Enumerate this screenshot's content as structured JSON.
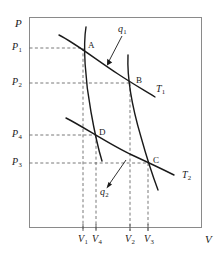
{
  "figure": {
    "kind": "carnot-cycle-pv-diagram",
    "axes": {
      "y_axis_label": "P",
      "x_axis_label": "V",
      "frame_color": "#8a8a8a",
      "curve_color": "#1a1a1a",
      "dash_color": "#555555"
    },
    "y_ticks": [
      {
        "label": "P",
        "sub": "1",
        "y": 48
      },
      {
        "label": "P",
        "sub": "2",
        "y": 83
      },
      {
        "label": "P",
        "sub": "4",
        "y": 135
      },
      {
        "label": "P",
        "sub": "3",
        "y": 163
      }
    ],
    "x_ticks": [
      {
        "label": "V",
        "sub": "1",
        "x": 83
      },
      {
        "label": "V",
        "sub": "4",
        "x": 96
      },
      {
        "label": "V",
        "sub": "2",
        "x": 130
      },
      {
        "label": "V",
        "sub": "3",
        "x": 148
      }
    ],
    "points": [
      {
        "name": "A",
        "label": "A",
        "x": 83,
        "y": 48,
        "label_x": 88,
        "label_y": 43
      },
      {
        "name": "B",
        "label": "B",
        "x": 130,
        "y": 83,
        "label_x": 136,
        "label_y": 78
      },
      {
        "name": "C",
        "label": "C",
        "x": 148,
        "y": 163,
        "label_x": 154,
        "label_y": 158
      },
      {
        "name": "D",
        "label": "D",
        "x": 95,
        "y": 135,
        "label_x": 100,
        "label_y": 130
      }
    ],
    "curves": [
      {
        "name": "isotherm-T1",
        "label": "T",
        "sub": "1",
        "label_x": 158,
        "label_y": 88
      },
      {
        "name": "isotherm-T2",
        "label": "T",
        "sub": "2",
        "label_x": 184,
        "label_y": 174
      },
      {
        "name": "adiabat-AD"
      },
      {
        "name": "adiabat-BC"
      }
    ],
    "annotations": [
      {
        "name": "heat-in",
        "label": "q",
        "sub": "1",
        "label_x": 119,
        "label_y": 27,
        "arrow_from_x": 121,
        "arrow_from_y": 36,
        "arrow_to_x": 107,
        "arrow_to_y": 64
      },
      {
        "name": "heat-out",
        "label": "q",
        "sub": "2",
        "label_x": 102,
        "label_y": 190,
        "arrow_from_x": 108,
        "arrow_from_y": 187,
        "arrow_to_x": 126,
        "arrow_to_y": 160
      }
    ]
  }
}
